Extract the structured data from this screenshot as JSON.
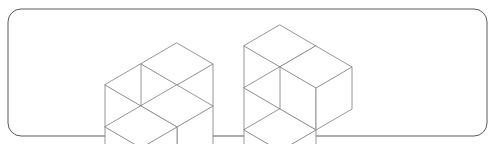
{
  "canvas": {
    "width": 494,
    "height": 144,
    "background_color": "#ffffff"
  },
  "frame": {
    "name": "rounded-rectangle-border",
    "x": 8,
    "y": 9,
    "width": 479,
    "height": 127,
    "corner_radius": 13,
    "stroke_color": "#5a5a5a",
    "fill_color": "#ffffff",
    "stroke_width": 1
  },
  "render_style": {
    "line_color": "#8a8a8a",
    "line_width": 0.9,
    "face_fill": "#ffffff",
    "iso_half_width": 36,
    "iso_half_height": 21,
    "iso_cube_height": 42
  },
  "figures": [
    {
      "id": "figure-left",
      "label": "Left isometric cube figure",
      "origin_x": 177,
      "origin_y": 85,
      "cube_count": 4,
      "cubes": [
        {
          "name": "cube-left-bottom-west",
          "gx": -1,
          "gy": 0,
          "gz": 0
        },
        {
          "name": "cube-left-bottom-south",
          "gx": 0,
          "gy": 1,
          "gz": 0
        },
        {
          "name": "cube-left-bottom-core",
          "gx": 0,
          "gy": 0,
          "gz": 0
        },
        {
          "name": "cube-left-top-stack",
          "gx": 0,
          "gy": 0,
          "gz": 1
        }
      ]
    },
    {
      "id": "figure-right",
      "label": "Right isometric cube figure",
      "origin_x": 316,
      "origin_y": 88,
      "cube_count": 4,
      "cubes": [
        {
          "name": "cube-right-bottom-west",
          "gx": -1,
          "gy": 0,
          "gz": 0
        },
        {
          "name": "cube-right-bottom-south",
          "gx": 0,
          "gy": 1,
          "gz": 0
        },
        {
          "name": "cube-right-back-upper",
          "gx": -1,
          "gy": 0,
          "gz": 1
        },
        {
          "name": "cube-right-top-stack",
          "gx": 0,
          "gy": 0,
          "gz": 1
        }
      ]
    }
  ]
}
